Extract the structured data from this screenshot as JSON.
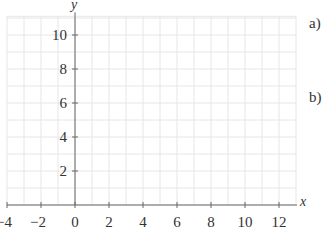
{
  "chart_data": {
    "type": "line",
    "title": "",
    "xlabel": "x",
    "ylabel": "y",
    "xlim": [
      -4,
      13
    ],
    "ylim": [
      0,
      11.1
    ],
    "grid": true,
    "grid_step": 1,
    "xticks": [
      -4,
      -2,
      0,
      2,
      4,
      6,
      8,
      10,
      12
    ],
    "xtick_labels": [
      "−4",
      "−2",
      "0",
      "2",
      "4",
      "6",
      "8",
      "10",
      "12"
    ],
    "yticks": [
      2,
      4,
      6,
      8,
      10
    ],
    "ytick_labels": [
      "2",
      "4",
      "6",
      "8",
      "10"
    ],
    "series": [],
    "annotations": [
      "a)",
      "b)"
    ],
    "colors": {
      "grid": "#e6e6e6",
      "axis": "#666666",
      "text": "#333333"
    }
  },
  "labels": {
    "x_axis": "x",
    "y_axis": "y",
    "part_a": "a)",
    "part_b": "b)"
  }
}
